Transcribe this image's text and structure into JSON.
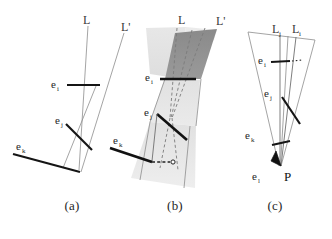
{
  "figure": {
    "kind": "line-correspondence-geometry-figure",
    "panels": [
      {
        "id": "a",
        "caption": "(a)",
        "labels": {
          "line_L": "L",
          "line_L_prime": "L'",
          "edge_i": "e",
          "edge_i_sub": "i",
          "edge_j": "e",
          "edge_j_sub": "j",
          "edge_k": "e",
          "edge_k_sub": "k"
        }
      },
      {
        "id": "b",
        "caption": "(b)",
        "labels": {
          "line_L": "L",
          "line_L_prime": "L'",
          "edge_i": "e",
          "edge_i_sub": "i",
          "edge_j": "e",
          "edge_j_sub": "j",
          "edge_k": "e",
          "edge_k_sub": "k"
        }
      },
      {
        "id": "c",
        "caption": "(c)",
        "labels": {
          "line_Lj": "L",
          "line_Lj_sub": "j",
          "line_Li": "L",
          "line_Li_sub": "i",
          "edge_i": "e",
          "edge_i_sub": "i",
          "edge_j": "e",
          "edge_j_sub": "j",
          "edge_k": "e",
          "edge_k_sub": "k",
          "edge_l": "e",
          "edge_l_sub": "l",
          "point_P": "P"
        }
      }
    ],
    "colors": {
      "background": "#ffffff",
      "thin_line": "#8d8d8d",
      "thick_edge": "#151515",
      "dashed_line": "#7a7a7a",
      "shade_dark": "#8f8f8f",
      "shade_light": "#dcdcdc",
      "text": "#1f1f1f"
    }
  }
}
